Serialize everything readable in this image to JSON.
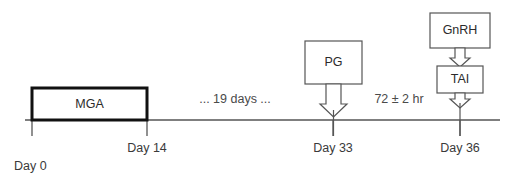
{
  "diagram": {
    "type": "timeline",
    "colors": {
      "background": "#ffffff",
      "line": "#555555",
      "emphasis_box_border": "#111111",
      "box_border": "#555555",
      "text": "#3a3a3a"
    },
    "timeline": {
      "start_x": 25,
      "end_x": 500,
      "baseline_y": 120,
      "tick_bottom_y": 135
    },
    "origin_label": "Day 0",
    "ticks": [
      {
        "label": "Day 0",
        "x": 32,
        "show_label_below": false
      },
      {
        "label": "Day 14",
        "x": 147,
        "show_label_below": true
      },
      {
        "label": "Day 33",
        "x": 333,
        "show_label_below": true
      },
      {
        "label": "Day 36",
        "x": 460,
        "show_label_below": true
      }
    ],
    "treatment_boxes": [
      {
        "label": "MGA",
        "style": "thick",
        "x": 32,
        "y": 88,
        "width": 115,
        "height": 32,
        "sits_on_timeline": true
      },
      {
        "label": "PG",
        "style": "thin",
        "x": 305,
        "y": 41,
        "width": 57,
        "height": 43,
        "arrow_to": "timeline",
        "arrow_target_x": 333
      },
      {
        "label": "GnRH",
        "style": "thin",
        "x": 430,
        "y": 13,
        "width": 60,
        "height": 35,
        "arrow_to": "TAI",
        "arrow_target_x": 460
      },
      {
        "label": "TAI",
        "style": "thin",
        "x": 437,
        "y": 66,
        "width": 46,
        "height": 27,
        "arrow_to": "timeline",
        "arrow_target_x": 460
      }
    ],
    "interval_labels": [
      {
        "text": "... 19 days ...",
        "x": 235,
        "y": 103
      },
      {
        "text": "72 ± 2 hr",
        "x": 399,
        "y": 103
      }
    ]
  }
}
